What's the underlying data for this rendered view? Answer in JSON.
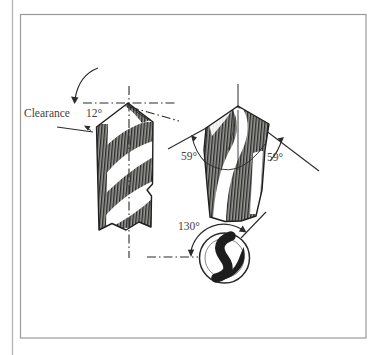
{
  "figure": {
    "side_view": {
      "clearance_label": "Clearance",
      "clearance_angle_value": "12°"
    },
    "front_view": {
      "left_point_angle_value": "59°",
      "right_point_angle_value": "59°"
    },
    "end_view": {
      "chisel_edge_angle_value": "130°"
    }
  },
  "colors": {
    "ink": "#2b2b2b",
    "label_text": "#474139",
    "frame_border": "#9a9a9a",
    "column_rule": "#b3b3b3",
    "paper": "#ffffff"
  }
}
